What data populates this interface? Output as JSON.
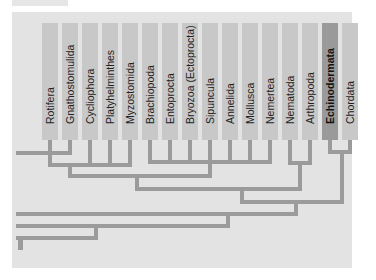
{
  "diagram": {
    "type": "phylogenetic-tree",
    "colors": {
      "panel": "#e3e3e3",
      "column": "#c8c8c8",
      "highlight_column": "#9a9a9a",
      "branch": "#9b9b9b"
    },
    "taxa": [
      {
        "label": "Rotifera"
      },
      {
        "label": "Gnathostomulida"
      },
      {
        "label": "Cycliophora"
      },
      {
        "label": "Platyhelminthes"
      },
      {
        "label": "Myzostomida"
      },
      {
        "label": "Brachiopoda"
      },
      {
        "label": "Entoprocta"
      },
      {
        "label": "Bryozoa (Ectoprocta)"
      },
      {
        "label": "Sipuncula"
      },
      {
        "label": "Annelida"
      },
      {
        "label": "Mollusca"
      },
      {
        "label": "Nemertea"
      },
      {
        "label": "Nematoda"
      },
      {
        "label": "Arthropoda"
      },
      {
        "label": "Echinodermata",
        "highlighted": true
      },
      {
        "label": "Chordata"
      }
    ]
  }
}
